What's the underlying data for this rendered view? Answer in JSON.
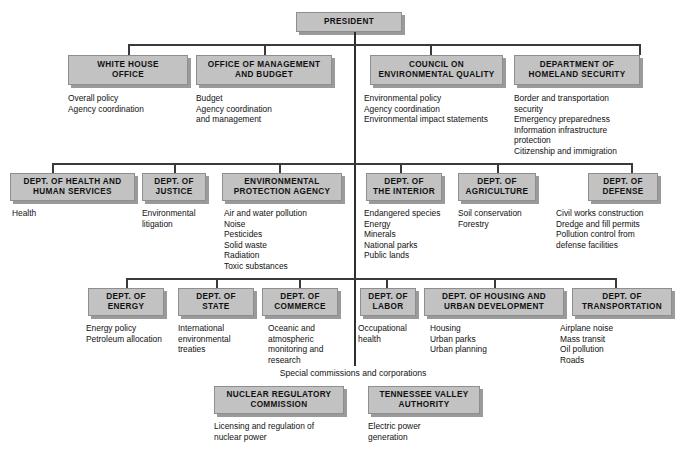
{
  "nodes": {
    "president": {
      "label": "PRESIDENT"
    },
    "white_house_office": {
      "label": "WHITE HOUSE\nOFFICE",
      "desc": "Overall policy\nAgency coordination"
    },
    "omb": {
      "label": "OFFICE OF MANAGEMENT\nAND BUDGET",
      "desc": "Budget\nAgency coordination\n  and management"
    },
    "ceq": {
      "label": "COUNCIL ON\nENVIRONMENTAL QUALITY",
      "desc": "Environmental policy\nAgency coordination\nEnvironmental impact statements"
    },
    "dhs": {
      "label": "DEPARTMENT OF\nHOMELAND SECURITY",
      "desc": "Border and transportation\n  security\nEmergency preparedness\nInformation infrastructure\n  protection\nCitizenship and immigration"
    },
    "hhs": {
      "label": "DEPT. OF HEALTH AND\nHUMAN SERVICES",
      "desc": "Health"
    },
    "justice": {
      "label": "DEPT. OF\nJUSTICE",
      "desc": "Environmental\nlitigation"
    },
    "epa": {
      "label": "ENVIRONMENTAL\nPROTECTION AGENCY",
      "desc": "Air and water pollution\nNoise\nPesticides\nSolid waste\nRadiation\nToxic substances"
    },
    "interior": {
      "label": "DEPT. OF\nTHE INTERIOR",
      "desc": "Endangered species\nEnergy\nMinerals\nNational parks\nPublic lands"
    },
    "agriculture": {
      "label": "DEPT. OF\nAGRICULTURE",
      "desc": "Soil conservation\nForestry"
    },
    "defense": {
      "label": "DEPT. OF\nDEFENSE",
      "desc": "Civil works construction\nDredge and fill permits\nPollution control from\n  defense facilities"
    },
    "energy": {
      "label": "DEPT. OF\nENERGY",
      "desc": "Energy policy\nPetroleum allocation"
    },
    "state": {
      "label": "DEPT. OF\nSTATE",
      "desc": "International\nenvironmental\ntreaties"
    },
    "commerce": {
      "label": "DEPT. OF\nCOMMERCE",
      "desc": "Oceanic and\natmospheric\nmonitoring and\nresearch"
    },
    "labor": {
      "label": "DEPT. OF\nLABOR",
      "desc": "Occupational\n  health"
    },
    "hud": {
      "label": "DEPT. OF HOUSING AND\nURBAN DEVELOPMENT",
      "desc": "Housing\nUrban parks\nUrban planning"
    },
    "transportation": {
      "label": "DEPT. OF\nTRANSPORTATION",
      "desc": "Airplane noise\nMass transit\nOil pollution\nRoads"
    },
    "nrc": {
      "label": "NUCLEAR REGULATORY\nCOMMISSION",
      "desc": "Licensing and regulation of\n  nuclear power"
    },
    "tva": {
      "label": "TENNESSEE VALLEY\nAUTHORITY",
      "desc": "Electric power\ngeneration"
    }
  },
  "captions": {
    "special": "Special commissions and corporations"
  },
  "colors": {
    "box_fill": "#c2c2c2",
    "box_border": "#8e8e8e",
    "box_shadow": "#9a9a9a",
    "line": "#3a3a3a",
    "text": "#111111",
    "background": "#ffffff"
  }
}
